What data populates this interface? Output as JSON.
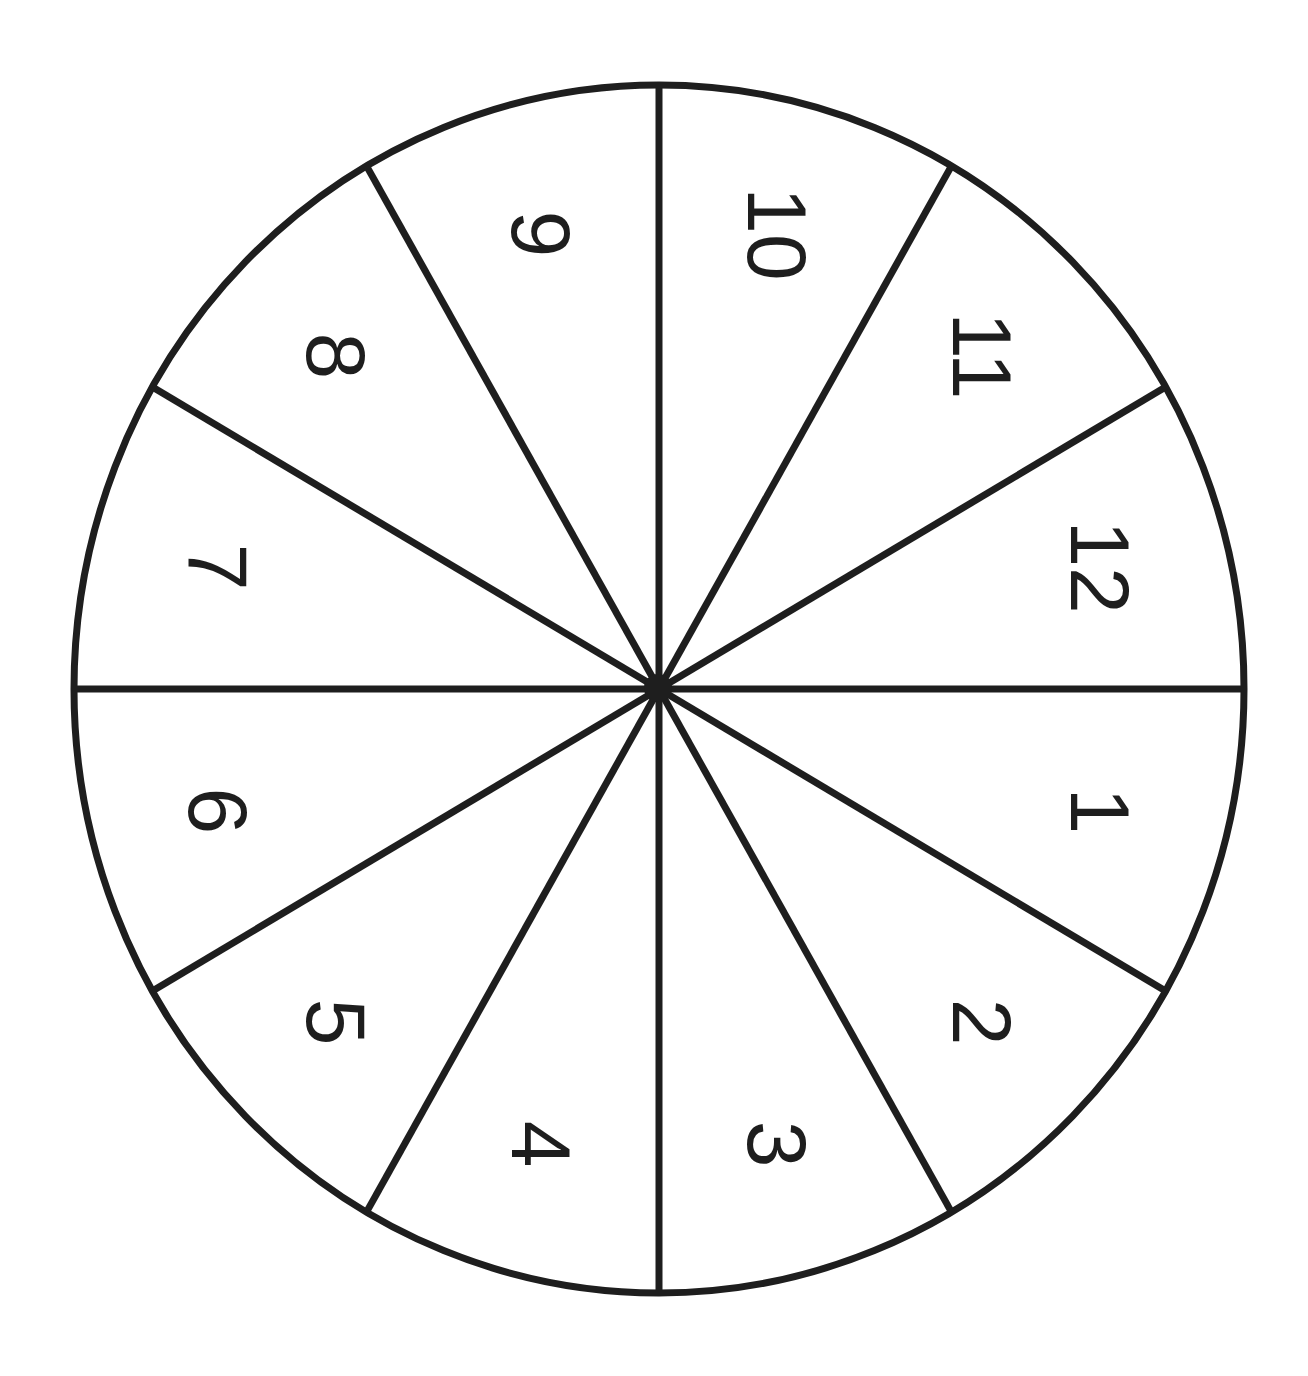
{
  "diagram": {
    "type": "spinner-wheel",
    "segment_count": 12,
    "center": [
      659,
      689
    ],
    "radius_x": 585,
    "radius_y": 604,
    "stroke_color": "#1e1e1e",
    "fill_color": "#ffffff",
    "label_rotation_deg": 90,
    "segments": [
      {
        "label": "1",
        "angle_center_deg": 15
      },
      {
        "label": "2",
        "angle_center_deg": 45
      },
      {
        "label": "3",
        "angle_center_deg": 75
      },
      {
        "label": "4",
        "angle_center_deg": 105
      },
      {
        "label": "5",
        "angle_center_deg": 135
      },
      {
        "label": "6",
        "angle_center_deg": 165
      },
      {
        "label": "7",
        "angle_center_deg": 195
      },
      {
        "label": "8",
        "angle_center_deg": 225
      },
      {
        "label": "9",
        "angle_center_deg": 255
      },
      {
        "label": "10",
        "angle_center_deg": 285
      },
      {
        "label": "11",
        "angle_center_deg": 315
      },
      {
        "label": "12",
        "angle_center_deg": 345
      }
    ]
  }
}
